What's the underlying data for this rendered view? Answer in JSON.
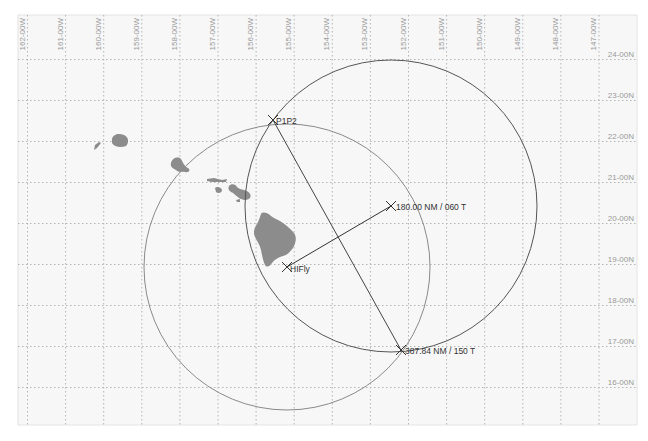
{
  "map": {
    "background": "#f7f7f7",
    "grid_color": "#b4b4b4",
    "land_color": "#8c8c8c",
    "frame": {
      "left": 18,
      "top": 15,
      "right": 637,
      "bottom": 425
    },
    "longitude_labels": [
      "162-00W",
      "161-00W",
      "160-00W",
      "159-00W",
      "158-00W",
      "157-00W",
      "156-00W",
      "155-00W",
      "154-00W",
      "153-00W",
      "152-00W",
      "151-00W",
      "150-00W",
      "149-00W",
      "148-00W",
      "147-00W"
    ],
    "latitude_labels": [
      "24-00N",
      "23-00N",
      "22-00N",
      "21-00N",
      "20-00N",
      "19-00N",
      "18-00N",
      "17-00N",
      "16-00N"
    ],
    "waypoints": [
      {
        "id": "p1p2",
        "label": "P1P2",
        "x": 273,
        "y": 120
      },
      {
        "id": "hifly",
        "label": "HIFly",
        "x": 287,
        "y": 267
      },
      {
        "id": "range-bearing-1",
        "label": "180.00 NM / 060 T",
        "x": 391,
        "y": 206
      },
      {
        "id": "range-bearing-2",
        "label": "387.84 NM / 150 T",
        "x": 401,
        "y": 350
      }
    ],
    "circles": [
      {
        "id": "circle-large",
        "cx": 391,
        "cy": 206,
        "r": 146,
        "color": "#555555"
      },
      {
        "id": "circle-small",
        "cx": 287,
        "cy": 267,
        "r": 143,
        "color": "#8a8a8a"
      }
    ]
  }
}
